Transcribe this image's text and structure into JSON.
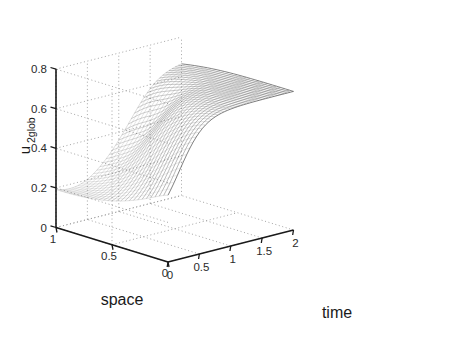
{
  "figure": {
    "background": "#ffffff",
    "line_color": "#555555",
    "axis_color": "#1a1a1a",
    "grid_color": "#9a9a9a"
  },
  "chart_data": {
    "type": "surface",
    "title": "",
    "xlabel": "time",
    "ylabel": "space",
    "zlabel": "u_2glob",
    "zlabel_base": "u",
    "zlabel_sub": "2glob",
    "xlim": [
      0,
      2
    ],
    "ylim": [
      0,
      1
    ],
    "zlim": [
      0,
      0.8
    ],
    "xticks": [
      0,
      0.5,
      1,
      1.5,
      2
    ],
    "xtick_labels": [
      "0",
      "0.5",
      "1",
      "1.5",
      "2"
    ],
    "yticks": [
      0,
      0.5,
      1
    ],
    "ytick_labels": [
      "0",
      "0.5",
      "1"
    ],
    "zticks": [
      0,
      0.2,
      0.4,
      0.6,
      0.8
    ],
    "ztick_labels": [
      "0",
      "0.2",
      "0.4",
      "0.6",
      "0.8"
    ],
    "grid": true,
    "legend": null,
    "mesh": {
      "style": "wireframe",
      "nx": 40,
      "ny": 26,
      "description": "Traveling wave / moving shock front surface u2glob(time, space). High plateau near z=0.7 for large time, steep front descending to a low valley near z=0.15 at space=1, small time."
    },
    "surface_values": {
      "plateau_high": 0.7,
      "plateau_mid": 0.62,
      "valley_low": 0.12,
      "valley_mid": 0.18,
      "front_drop": 0.55
    }
  },
  "axes": {
    "time_label": "time",
    "space_label": "space"
  }
}
